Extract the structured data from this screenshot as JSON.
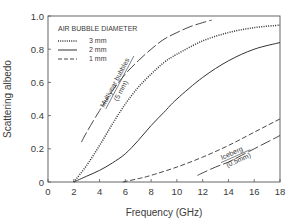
{
  "chart_data": {
    "type": "line",
    "title": "",
    "xlabel": "Frequency (GHz)",
    "ylabel": "Scattering albedo",
    "xlim": [
      0,
      18
    ],
    "ylim": [
      0,
      1.0
    ],
    "x_ticks": [
      "0",
      "2",
      "4",
      "6",
      "8",
      "10",
      "12",
      "14",
      "16",
      "18"
    ],
    "y_ticks": [
      "0",
      "0.2",
      "0.4",
      "0.6",
      "0.8",
      "1.0"
    ],
    "grid": false,
    "legend": {
      "title": "AIR BUBBLE DIAMETER",
      "position": "upper-left",
      "entries": [
        {
          "label": "3 mm",
          "style": "dotted"
        },
        {
          "label": "2 mm",
          "style": "solid"
        },
        {
          "label": "1 mm",
          "style": "dashed"
        }
      ]
    },
    "series": [
      {
        "name": "3 mm",
        "style": "dotted",
        "x": [
          2,
          3,
          4,
          5,
          6,
          7,
          8,
          9,
          10,
          12,
          14,
          16,
          18
        ],
        "y": [
          0,
          0.1,
          0.22,
          0.35,
          0.47,
          0.57,
          0.65,
          0.72,
          0.77,
          0.85,
          0.9,
          0.93,
          0.945
        ]
      },
      {
        "name": "2 mm",
        "style": "solid",
        "x": [
          2,
          3,
          4,
          5,
          6,
          7,
          8,
          9,
          10,
          12,
          14,
          16,
          18
        ],
        "y": [
          0,
          0.035,
          0.07,
          0.115,
          0.17,
          0.25,
          0.34,
          0.42,
          0.5,
          0.63,
          0.73,
          0.8,
          0.84
        ]
      },
      {
        "name": "1 mm",
        "style": "dashed",
        "x": [
          5.8,
          7,
          8,
          10,
          12,
          14,
          16,
          18
        ],
        "y": [
          0,
          0.02,
          0.04,
          0.09,
          0.15,
          0.22,
          0.3,
          0.38
        ]
      },
      {
        "name": "Multiyear bubbles (5 mm)",
        "style": "long-dash",
        "x": [
          2.6,
          3,
          4,
          5,
          6,
          7,
          8,
          9,
          10,
          11,
          12,
          12.7
        ],
        "y": [
          0.24,
          0.3,
          0.43,
          0.55,
          0.65,
          0.73,
          0.8,
          0.86,
          0.9,
          0.935,
          0.96,
          0.975
        ]
      },
      {
        "name": "Iceberg (0.5 mm)",
        "style": "long-dash",
        "x": [
          11.6,
          12,
          13,
          14,
          15,
          16,
          17,
          18
        ],
        "y": [
          0.04,
          0.055,
          0.09,
          0.12,
          0.16,
          0.2,
          0.24,
          0.28
        ]
      }
    ],
    "annotations": [
      {
        "text": "Multiyear bubbles",
        "subtext": "(5 mm)",
        "near_series": "Multiyear bubbles (5 mm)"
      },
      {
        "text": "Iceberg",
        "subtext": "(0.5mm)",
        "near_series": "Iceberg (0.5 mm)"
      }
    ]
  },
  "labels": {
    "xlabel": "Frequency (GHz)",
    "ylabel": "Scattering albedo",
    "legend_title": "AIR BUBBLE DIAMETER",
    "legend_3mm": "3 mm",
    "legend_2mm": "2 mm",
    "legend_1mm": "1 mm",
    "multiyear_line1": "Multiyear bubbles",
    "multiyear_line2": "(5 mm)",
    "iceberg_line1": "Iceberg",
    "iceberg_line2": "(0.5mm)"
  }
}
